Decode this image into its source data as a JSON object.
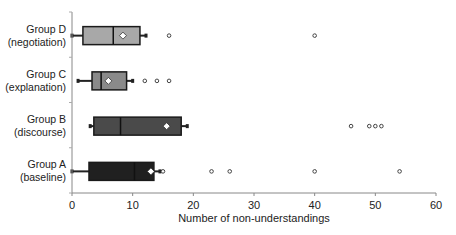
{
  "chart_data": {
    "type": "boxplot",
    "orientation": "horizontal",
    "title": "",
    "xlabel": "Number of non-understandings",
    "ylabel": "",
    "xlim": [
      0,
      60
    ],
    "xticks": [
      0,
      10,
      20,
      30,
      40,
      50,
      60
    ],
    "grid": false,
    "legend": null,
    "categories": [
      "Group D (negotiation)",
      "Group C (explanation)",
      "Group B (discourse)",
      "Group A (baseline)"
    ],
    "groups": [
      {
        "name": "Group D",
        "subtitle": "(negotiation)",
        "color": "#a8a8a8",
        "whisker_low": 0,
        "q1": 1.8,
        "median": 6.8,
        "q3": 11.2,
        "whisker_high": 12.2,
        "mean": 8.4,
        "outliers": [
          16,
          40
        ]
      },
      {
        "name": "Group C",
        "subtitle": "(explanation)",
        "color": "#8a8a8a",
        "whisker_low": 1,
        "q1": 3.3,
        "median": 4.8,
        "q3": 9,
        "whisker_high": 10,
        "mean": 6,
        "outliers": [
          12,
          14,
          16
        ]
      },
      {
        "name": "Group B",
        "subtitle": "(discourse)",
        "color": "#4a4a4a",
        "whisker_low": 3,
        "q1": 3.6,
        "median": 8,
        "q3": 18,
        "whisker_high": 19,
        "mean": 15.6,
        "outliers": [
          46,
          49,
          50,
          51
        ]
      },
      {
        "name": "Group A",
        "subtitle": "(baseline)",
        "color": "#202020",
        "whisker_low": 0,
        "q1": 2.8,
        "median": 10.3,
        "q3": 13.5,
        "whisker_high": 14.5,
        "mean": 13,
        "outliers": [
          15,
          23,
          26,
          40,
          54
        ]
      }
    ]
  }
}
